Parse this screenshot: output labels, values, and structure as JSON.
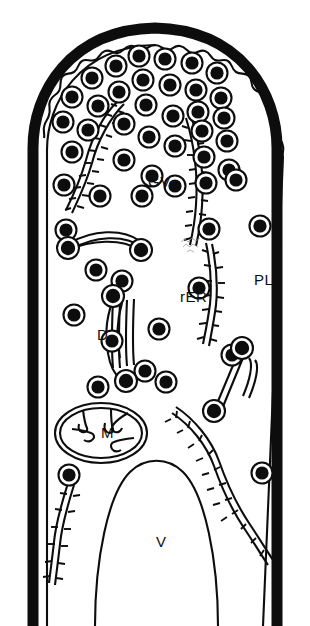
{
  "figure": {
    "background_color": "#ffffff",
    "ink_color": "#0d0d0d",
    "width": 310,
    "height": 626
  },
  "labels": [
    {
      "id": "gv",
      "text": "GV",
      "x": 148,
      "y": 187,
      "meaning": "golgi-vesicles"
    },
    {
      "id": "rer",
      "text": "rER",
      "x": 180,
      "y": 302,
      "meaning": "rough-endoplasmic-reticulum"
    },
    {
      "id": "pl",
      "text": "PL",
      "x": 254,
      "y": 285,
      "meaning": "plasmalemma-cell-wall"
    },
    {
      "id": "d",
      "text": "D",
      "x": 97,
      "y": 340,
      "meaning": "dictyosome"
    },
    {
      "id": "m",
      "text": "M",
      "x": 101,
      "y": 438,
      "meaning": "mitochondrion"
    },
    {
      "id": "v",
      "text": "V",
      "x": 156,
      "y": 547,
      "meaning": "vacuole"
    }
  ],
  "structures": {
    "cell_wall": {
      "name": "cell-wall",
      "stroke_width": 11
    },
    "plasma_membrane": {
      "name": "plasmalemma",
      "style": "scalloped-at-apex"
    },
    "vesicles": {
      "name": "golgi-vesicle",
      "count": 46,
      "style": "black-core-white-ring"
    },
    "rer_strands": {
      "name": "rough-er-strand",
      "count": 5,
      "style": "ribosome-studded-double-line"
    },
    "dictyosome": {
      "name": "dictyosome-stack",
      "count": 2
    },
    "mitochondrion": {
      "name": "mitochondrion",
      "cristae": 4
    },
    "vacuole": {
      "name": "vacuole"
    },
    "tubules": {
      "name": "smooth-tubule",
      "count": 2
    },
    "smudge": {
      "name": "ink-smudge-artifact"
    }
  },
  "vesicle_positions": [
    [
      139,
      56
    ],
    [
      165,
      59
    ],
    [
      192,
      63
    ],
    [
      116,
      66
    ],
    [
      217,
      73
    ],
    [
      143,
      80
    ],
    [
      92,
      78
    ],
    [
      170,
      85
    ],
    [
      196,
      90
    ],
    [
      119,
      92
    ],
    [
      221,
      98
    ],
    [
      72,
      97
    ],
    [
      146,
      105
    ],
    [
      98,
      106
    ],
    [
      198,
      112
    ],
    [
      173,
      116
    ],
    [
      63,
      122
    ],
    [
      224,
      118
    ],
    [
      124,
      124
    ],
    [
      88,
      130
    ],
    [
      149,
      137
    ],
    [
      202,
      131
    ],
    [
      175,
      146
    ],
    [
      227,
      141
    ],
    [
      72,
      152
    ],
    [
      204,
      157
    ],
    [
      124,
      160
    ],
    [
      152,
      176
    ],
    [
      229,
      170
    ],
    [
      64,
      185
    ],
    [
      100,
      196
    ],
    [
      142,
      196
    ],
    [
      175,
      186
    ],
    [
      236,
      180
    ],
    [
      206,
      183
    ],
    [
      66,
      230
    ],
    [
      96,
      270
    ],
    [
      122,
      281
    ],
    [
      159,
      329
    ],
    [
      199,
      288
    ],
    [
      260,
      226
    ],
    [
      74,
      315
    ],
    [
      112,
      341
    ],
    [
      166,
      382
    ],
    [
      145,
      371
    ],
    [
      232,
      355
    ],
    [
      262,
      473
    ],
    [
      69,
      475
    ],
    [
      98,
      387
    ],
    [
      209,
      229
    ]
  ]
}
